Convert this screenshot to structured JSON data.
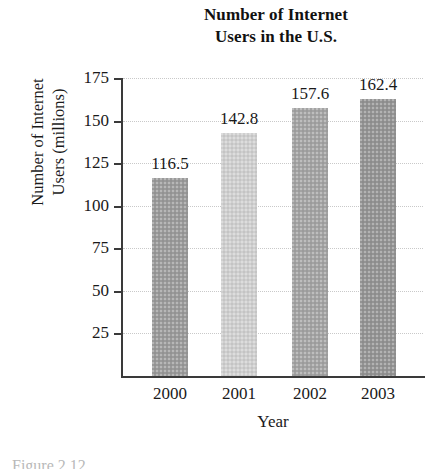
{
  "title": {
    "line1": "Number of Internet",
    "line2": "Users in the U.S."
  },
  "axis_titles": {
    "y_line1": "Number of Internet",
    "y_line2": "Users (millions)",
    "x": "Year"
  },
  "caption": "Figure 2.12",
  "colors": {
    "bar_2000": "#9a9a9a",
    "bar_2001": "#cfcfcf",
    "bar_2002": "#a3a3a3",
    "bar_2003": "#949494",
    "axis": "#3a3a3a",
    "gridline": "#c9c9c9",
    "text": "#1a1a1a",
    "background": "#ffffff"
  },
  "chart_data": {
    "type": "bar",
    "title": "Number of Internet Users in the U.S.",
    "xlabel": "Year",
    "ylabel": "Number of Internet Users (millions)",
    "categories": [
      "2000",
      "2001",
      "2002",
      "2003"
    ],
    "values": [
      116.5,
      142.8,
      157.6,
      162.4
    ],
    "value_labels": [
      "116.5",
      "142.8",
      "157.6",
      "162.4"
    ],
    "bar_colors": [
      "#9a9a9a",
      "#cfcfcf",
      "#a3a3a3",
      "#949494"
    ],
    "ylim": [
      0,
      175
    ],
    "yticks": [
      25,
      50,
      75,
      100,
      125,
      150,
      175
    ],
    "ytick_labels": [
      "25",
      "50",
      "75",
      "100",
      "125",
      "150",
      "175"
    ],
    "grid": true,
    "grid_axis": "y",
    "legend": "none"
  }
}
